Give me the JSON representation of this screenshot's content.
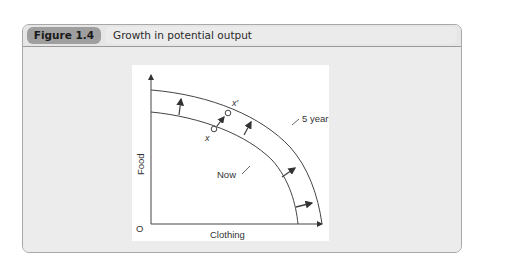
{
  "figure": {
    "label": "Figure 1.4",
    "title": "Growth in potential output"
  },
  "diagram": {
    "y_axis_label": "Food",
    "x_axis_label": "Clothing",
    "origin_label": "O",
    "curves": [
      {
        "name": "Now",
        "label": "Now"
      },
      {
        "name": "5 years' time",
        "label": "5 years' time"
      }
    ],
    "points": [
      {
        "name": "x",
        "label": "x"
      },
      {
        "name": "x-prime",
        "label": "x′"
      }
    ],
    "shift_arrows_count": 4
  },
  "colors": {
    "label_badge": "#9f9f9f",
    "header_bg": "#e6e6e6",
    "panel_bg": "#ececec",
    "plot_bg": "#ffffff",
    "line": "#444444"
  }
}
